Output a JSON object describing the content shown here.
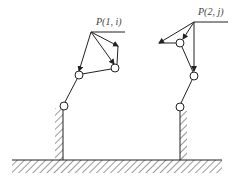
{
  "diagram": {
    "type": "two-linkage mechanism schematic",
    "labels": {
      "p1": "P(1, i)",
      "p2": "P(2, j)"
    },
    "colors": {
      "stroke": "#222222",
      "background": "#ffffff",
      "label": "#444444"
    },
    "left_mechanism": {
      "label_key": "p1",
      "ground_pin": [
        64,
        106
      ],
      "joints": [
        [
          79,
          75
        ],
        [
          115,
          68
        ]
      ],
      "end_point": [
        91,
        32
      ]
    },
    "right_mechanism": {
      "label_key": "p2",
      "ground_pin": [
        180,
        107
      ],
      "joints": [
        [
          194,
          76
        ],
        [
          180,
          43
        ]
      ],
      "end_point": [
        194,
        22
      ]
    }
  }
}
